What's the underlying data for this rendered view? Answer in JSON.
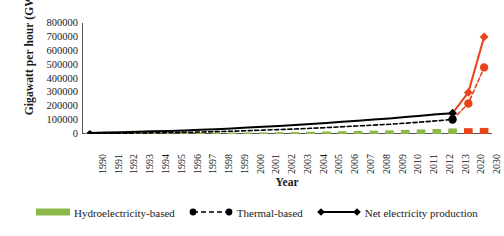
{
  "chart_data": {
    "type": "bar",
    "title": "",
    "xlabel": "Year",
    "ylabel": "Gigawatt per hour (GWh)",
    "ylim": [
      0,
      800000
    ],
    "ytick_values": [
      0,
      100000,
      200000,
      300000,
      400000,
      500000,
      600000,
      700000,
      800000
    ],
    "ytick_labels": [
      "0",
      "100000",
      "200000",
      "300000",
      "400000",
      "500000",
      "600000",
      "700000",
      "800000"
    ],
    "grid": false,
    "legend_position": "bottom",
    "categories": [
      "1990",
      "1991",
      "1992",
      "1993",
      "1994",
      "1995",
      "1996",
      "1997",
      "1998",
      "1999",
      "2000",
      "2001",
      "2002",
      "2003",
      "2004",
      "2005",
      "2006",
      "2007",
      "2008",
      "2009",
      "2010",
      "2011",
      "2012",
      "2013",
      "2020",
      "2030"
    ],
    "series": [
      {
        "name": "Hydroelectricity-based",
        "type": "bar",
        "color": "#8cb84a",
        "projection_color": "#e8441a",
        "values": [
          4000,
          4500,
          5000,
          5500,
          6000,
          6500,
          7000,
          8000,
          9000,
          10000,
          11000,
          12000,
          13000,
          14000,
          16000,
          18000,
          20000,
          22000,
          24000,
          26000,
          30000,
          33000,
          36000,
          40000,
          42000,
          44000
        ]
      },
      {
        "name": "Thermal-based",
        "type": "line",
        "style": "dashed",
        "marker": "circle",
        "color": "#000000",
        "projection_color": "#e8441a",
        "values": [
          3000,
          4000,
          5500,
          7000,
          8500,
          10000,
          12000,
          14000,
          17000,
          20000,
          24000,
          28000,
          32000,
          36000,
          41000,
          46000,
          52000,
          58000,
          64000,
          70000,
          78000,
          86000,
          95000,
          105000,
          220000,
          480000
        ]
      },
      {
        "name": "Net electricity production",
        "type": "line",
        "style": "solid",
        "marker": "diamond",
        "color": "#000000",
        "projection_color": "#e8441a",
        "values": [
          8000,
          10000,
          13000,
          16000,
          19000,
          22000,
          26000,
          30000,
          35000,
          40000,
          46000,
          52000,
          58000,
          65000,
          72000,
          80000,
          88000,
          96000,
          104000,
          112000,
          122000,
          132000,
          142000,
          150000,
          300000,
          700000
        ]
      }
    ]
  },
  "legend": {
    "items": [
      {
        "label": "Hydroelectricity-based",
        "glyph": "bar-swatch"
      },
      {
        "label": "Thermal-based",
        "glyph": "dashed-line-circle-markers"
      },
      {
        "label": "Net electricity production",
        "glyph": "solid-line-diamond-markers"
      }
    ]
  }
}
